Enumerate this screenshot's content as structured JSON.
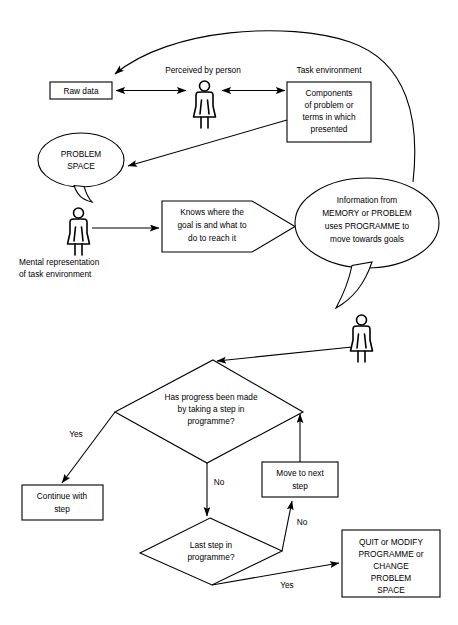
{
  "diagram": {
    "background_color": "#ffffff",
    "line_color": "#000000",
    "nodes": {
      "raw_data": {
        "label": "Raw data",
        "shape": "rectangle"
      },
      "perceived_label": {
        "label": "Perceived by person",
        "shape": "text"
      },
      "task_env_label": {
        "label": "Task environment",
        "shape": "text"
      },
      "components": {
        "shape": "rectangle",
        "lines": [
          "Components",
          "of problem or",
          "terms in which",
          "presented"
        ]
      },
      "problem_space": {
        "shape": "speech-ellipse",
        "lines": [
          "PROBLEM",
          "SPACE"
        ]
      },
      "mental_rep_label": {
        "shape": "text",
        "lines": [
          "Mental representation",
          "of task environment"
        ]
      },
      "knows_where": {
        "shape": "callout-box",
        "lines": [
          "Knows where the",
          "goal is and what to",
          "do to reach it"
        ]
      },
      "information_from": {
        "shape": "speech-ellipse",
        "lines": [
          "Information from",
          "MEMORY or PROBLEM",
          "uses PROGRAMME to",
          "move towards goals"
        ]
      },
      "decision_progress": {
        "shape": "diamond",
        "lines": [
          "Has progress been made",
          "by taking a step in",
          "programme?"
        ]
      },
      "continue_with_step": {
        "shape": "rectangle",
        "lines": [
          "Continue with",
          "step"
        ]
      },
      "move_to_next_step": {
        "shape": "rectangle",
        "lines": [
          "Move to next",
          "step"
        ]
      },
      "decision_last_step": {
        "shape": "diamond",
        "lines": [
          "Last step in",
          "programme?"
        ]
      },
      "quit_or_modify": {
        "shape": "rectangle",
        "lines": [
          "QUIT or MODIFY",
          "PROGRAMME or",
          "CHANGE",
          "PROBLEM",
          "SPACE"
        ]
      }
    },
    "edge_labels": {
      "progress_yes": "Yes",
      "progress_no": "No",
      "last_step_no": "No",
      "last_step_yes": "Yes"
    },
    "people": {
      "person_top": "person-figure",
      "person_middle": "person-figure",
      "person_lower": "person-figure"
    }
  }
}
